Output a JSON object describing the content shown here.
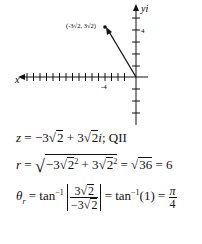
{
  "graph": {
    "x_axis_label": "x",
    "y_axis_label": "yi",
    "x_tick_label": "-4",
    "y_tick_label": "4",
    "point_label": "(-3√2, 3√2)",
    "origin_px": [
      133,
      77
    ],
    "unit_px": 6.5,
    "point_px": [
      105,
      22
    ]
  },
  "equations": {
    "z_line": {
      "lhs": "z",
      "eq": " = −3",
      "r1": "2",
      "mid": " + 3",
      "r2": "2",
      "tail": "i",
      "quad": ";  QII"
    },
    "r_line": {
      "lhs": "r",
      "eq": " = ",
      "a": "−3",
      "ar": "2",
      "exp1": "2",
      "plus": " + 3",
      "br": "2",
      "exp2": "2",
      "res1": " = ",
      "r36": "36",
      "res2": " = 6"
    },
    "theta_line": {
      "lhs": "θ",
      "sub": "r",
      "eq": " = tan",
      "inv": "−1",
      "num": "3",
      "numr": "2",
      "den": "−3",
      "denr": "2",
      "mid": " = tan",
      "inv2": "−1",
      "arg": "(1) = ",
      "fnum": "π",
      "fden": "4"
    }
  }
}
